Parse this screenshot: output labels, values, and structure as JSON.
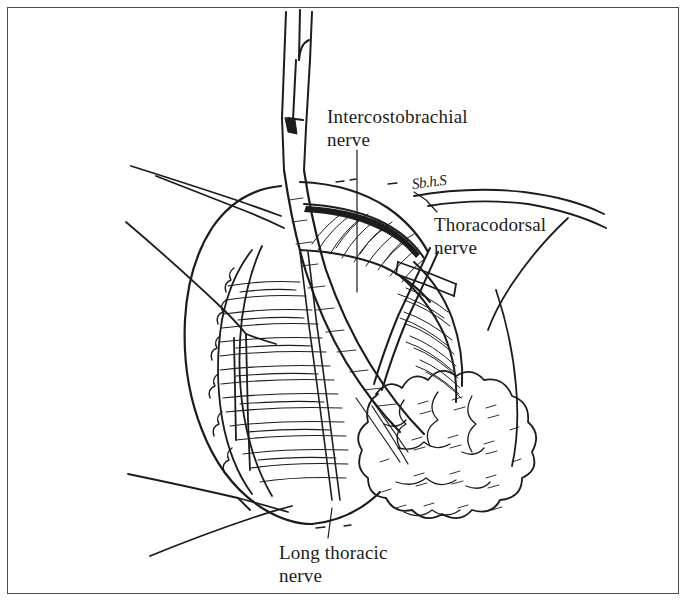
{
  "figure": {
    "medium": "pen-and-ink line drawing",
    "background_color": "#ffffff",
    "ink_color": "#1c1c1c",
    "frame_color": "#4a4a4a"
  },
  "labels": {
    "intercostobrachial": {
      "line1": "Intercostobrachial",
      "line2": "nerve"
    },
    "thoracodorsal": {
      "line1": "Thoracodorsal",
      "line2": "nerve"
    },
    "long_thoracic": {
      "line1": "Long thoracic",
      "line2": "nerve"
    }
  },
  "signature": {
    "text": "Sb.h.S"
  }
}
